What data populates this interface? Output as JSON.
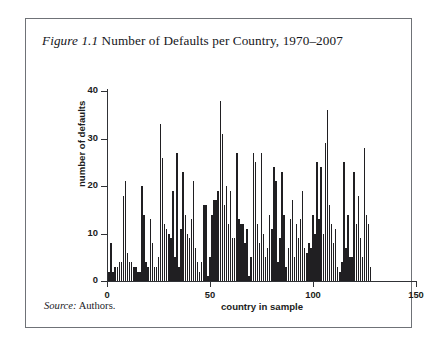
{
  "figure": {
    "label": "Figure 1.1",
    "title": " Number of Defaults per Country, 1970–2007",
    "source_label": "Source:",
    "source_value": " Authors."
  },
  "chart_data": {
    "type": "bar",
    "title": "Number of Defaults per Country, 1970–2007",
    "xlabel": "country in sample",
    "ylabel": "number of defaults",
    "xlim": [
      0,
      150
    ],
    "ylim": [
      0,
      40
    ],
    "xticks": [
      0,
      50,
      100,
      150
    ],
    "yticks": [
      0,
      10,
      20,
      30,
      40
    ],
    "grid": false,
    "legend": null,
    "bar_color": "#201f22",
    "x": [
      1,
      2,
      3,
      4,
      5,
      6,
      7,
      8,
      9,
      10,
      11,
      12,
      13,
      14,
      15,
      16,
      17,
      18,
      19,
      20,
      21,
      22,
      23,
      24,
      25,
      26,
      27,
      28,
      29,
      30,
      31,
      32,
      33,
      34,
      35,
      36,
      37,
      38,
      39,
      40,
      41,
      42,
      43,
      44,
      45,
      46,
      47,
      48,
      49,
      50,
      51,
      52,
      53,
      54,
      55,
      56,
      57,
      58,
      59,
      60,
      61,
      62,
      63,
      64,
      65,
      66,
      67,
      68,
      69,
      70,
      71,
      72,
      73,
      74,
      75,
      76,
      77,
      78,
      79,
      80,
      81,
      82,
      83,
      84,
      85,
      86,
      87,
      88,
      89,
      90,
      91,
      92,
      93,
      94,
      95,
      96,
      97,
      98,
      99,
      100,
      101,
      102,
      103,
      104,
      105,
      106,
      107,
      108,
      109,
      110,
      111,
      112,
      113,
      114,
      115,
      116,
      117,
      118,
      119,
      120,
      121,
      122,
      123,
      124,
      125,
      126,
      127,
      128
    ],
    "values": [
      2,
      8,
      2,
      3,
      3,
      4,
      4,
      18,
      21,
      6,
      4,
      4,
      3,
      3,
      2,
      2,
      20,
      14,
      4,
      3,
      13,
      8,
      3,
      3,
      5,
      33,
      26,
      12,
      11,
      10,
      9,
      19,
      5,
      27,
      3,
      11,
      23,
      14,
      10,
      9,
      13,
      21,
      7,
      4,
      2,
      4,
      16,
      16,
      1,
      5,
      14,
      17,
      17,
      19,
      38,
      31,
      16,
      20,
      12,
      19,
      9,
      9,
      27,
      13,
      12,
      12,
      8,
      11,
      1,
      5,
      27,
      25,
      12,
      8,
      27,
      10,
      5,
      7,
      14,
      11,
      24,
      21,
      4,
      9,
      23,
      14,
      3,
      7,
      13,
      17,
      5,
      12,
      9,
      13,
      19,
      7,
      6,
      8,
      7,
      14,
      10,
      25,
      13,
      24,
      10,
      29,
      36,
      16,
      12,
      8,
      11,
      3,
      2,
      4,
      25,
      7,
      14,
      5,
      5,
      23,
      12,
      18,
      9,
      5,
      28,
      14,
      12,
      3
    ]
  }
}
